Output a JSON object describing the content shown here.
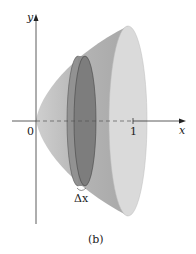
{
  "figure": {
    "caption": "(b)",
    "axes": {
      "x_label": "x",
      "y_label": "y",
      "origin_label": "0",
      "x_tick_label": "1"
    },
    "slice_label": "Δx",
    "colors": {
      "solid_body": "#b8b8b8",
      "solid_end_face": "#d9d9d9",
      "disk_slice": "#8a8a8a",
      "disk_slice_front": "#7a7a7a",
      "axis": "#333333",
      "background": "#ffffff"
    }
  }
}
